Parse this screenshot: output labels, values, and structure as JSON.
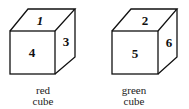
{
  "cubes": [
    {
      "color_name": "red",
      "label_line1": "red",
      "label_line2": "cube",
      "faces": {
        "top": "1",
        "front": "4",
        "right": "3"
      }
    },
    {
      "color_name": "green",
      "label_line1": "green",
      "label_line2": "cube",
      "faces": {
        "top": "2",
        "front": "5",
        "right": "6"
      }
    }
  ],
  "colors": {
    "stroke": "#111111",
    "background": "#ffffff"
  }
}
